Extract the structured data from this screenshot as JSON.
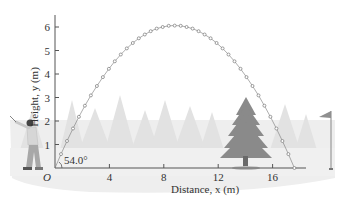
{
  "figure": {
    "y_axis_label": "Height, y (m)",
    "x_axis_label": "Distance, x (m)",
    "angle_label": "54.0°",
    "origin_label": "O",
    "colors": {
      "trajectory": "#777777",
      "axis": "#555555",
      "ground": "#e6e6e6",
      "trees_background": "#e0e0e0",
      "tree": "#8a8a8a",
      "golfer_shirt": "#d7d7d7",
      "golfer_pants": "#a8a8a8",
      "flag": "#909090"
    },
    "icons": [
      "golfer-illustration",
      "pine-tree-illustration",
      "golf-flag-icon",
      "background-trees"
    ]
  },
  "chart_data": {
    "type": "scatter",
    "title": "",
    "xlabel": "Distance, x (m)",
    "ylabel": "Height, y (m)",
    "xlim": [
      0,
      19
    ],
    "ylim": [
      0,
      6.5
    ],
    "x_ticks": [
      0,
      4,
      8,
      12,
      16
    ],
    "x_tick_labels": [
      "O",
      "4",
      "8",
      "12",
      "16"
    ],
    "y_ticks": [
      1,
      2,
      3,
      4,
      5,
      6
    ],
    "y_tick_labels": [
      "1",
      "2",
      "3",
      "4",
      "5",
      "6"
    ],
    "grid": false,
    "legend": null,
    "annotations": [
      "54.0°"
    ],
    "series": [
      {
        "name": "Projectile trajectory",
        "launch_angle_deg": 54.0,
        "range_m": 17.6,
        "max_height_m": 6.06,
        "x": [
          0,
          0.44,
          0.88,
          1.32,
          1.76,
          2.2,
          2.64,
          3.08,
          3.52,
          3.96,
          4.4,
          4.84,
          5.28,
          5.72,
          6.16,
          6.6,
          7.04,
          7.48,
          7.92,
          8.36,
          8.8,
          9.24,
          9.68,
          10.12,
          10.56,
          11.0,
          11.44,
          11.88,
          12.32,
          12.76,
          13.2,
          13.64,
          14.08,
          14.52,
          14.96,
          15.4,
          15.84,
          16.28,
          16.72,
          17.16,
          17.6
        ],
        "y": [
          0,
          0.59,
          1.15,
          1.68,
          2.18,
          2.65,
          3.09,
          3.49,
          3.87,
          4.22,
          4.54,
          4.83,
          5.09,
          5.32,
          5.52,
          5.68,
          5.82,
          5.93,
          6.0,
          6.05,
          6.06,
          6.05,
          6.0,
          5.93,
          5.82,
          5.68,
          5.52,
          5.32,
          5.09,
          4.83,
          4.54,
          4.22,
          3.87,
          3.49,
          3.09,
          2.65,
          2.18,
          1.68,
          1.15,
          0.59,
          0
        ]
      }
    ]
  }
}
